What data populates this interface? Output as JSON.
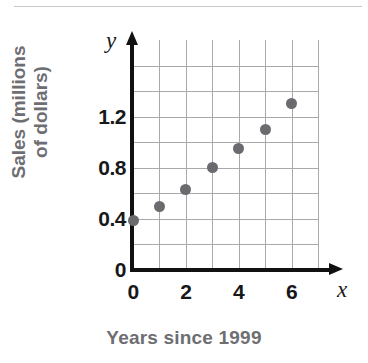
{
  "chart_data": {
    "type": "scatter",
    "title": "",
    "xlabel": "Years since 1999",
    "ylabel_lines": [
      "Sales (millions",
      "of dollars)"
    ],
    "x_variable": "x",
    "y_variable": "y",
    "x": [
      0,
      1,
      2,
      3,
      4,
      5,
      6
    ],
    "values": [
      0.39,
      0.5,
      0.63,
      0.8,
      0.95,
      1.1,
      1.3
    ],
    "points": [
      {
        "x": 0,
        "y": 0.39
      },
      {
        "x": 1,
        "y": 0.5
      },
      {
        "x": 2,
        "y": 0.63
      },
      {
        "x": 3,
        "y": 0.8
      },
      {
        "x": 4,
        "y": 0.95
      },
      {
        "x": 5,
        "y": 1.1
      },
      {
        "x": 6,
        "y": 1.3
      }
    ],
    "xlim": [
      0,
      7
    ],
    "ylim": [
      0,
      1.8
    ],
    "x_tick_labels": [
      "0",
      "2",
      "4",
      "6"
    ],
    "x_tick_values": [
      0,
      2,
      4,
      6
    ],
    "x_gridline_values": [
      0,
      1,
      2,
      3,
      4,
      5,
      6,
      7
    ],
    "y_tick_labels": [
      "0",
      "0.4",
      "0.8",
      "1.2"
    ],
    "y_tick_values": [
      0,
      0.4,
      0.8,
      1.2
    ],
    "y_gridline_values": [
      0,
      0.2,
      0.4,
      0.6,
      0.8,
      1.0,
      1.2,
      1.4,
      1.6
    ],
    "grid": true,
    "legend": "none",
    "point_color": "#6b6b6f",
    "grid_color": "#a9a9ad",
    "axis_color": "#111111",
    "label_color": "#6e6e72"
  }
}
